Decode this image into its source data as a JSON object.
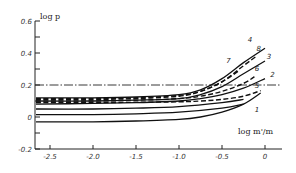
{
  "chart_data": {
    "type": "line",
    "title": "",
    "xlabel": "log m'/m",
    "ylabel": "log p",
    "xlim": [
      -2.75,
      0.2
    ],
    "ylim": [
      -0.2,
      0.6
    ],
    "xticks": [
      -2.5,
      -2.0,
      -1.5,
      -1.0,
      -0.5,
      0
    ],
    "xtick_labels": [
      "-2.5",
      "-2.0",
      "-1.5",
      "-1.0",
      "-0.5",
      "0"
    ],
    "yticks": [
      -0.2,
      0,
      0.2,
      0.4,
      0.6
    ],
    "ytick_labels": [
      "-0.2",
      "0",
      "0.2",
      "0.4",
      "0.6"
    ],
    "grid": false,
    "legend": "inline curve numbers",
    "reference_line": {
      "style": "dash-dot",
      "y": 0.2
    },
    "series": [
      {
        "name": "4",
        "style": "solid",
        "x": [
          -2.75,
          -2.0,
          -1.5,
          -1.0,
          -0.75,
          -0.5,
          -0.25,
          0
        ],
        "y": [
          0.12,
          0.12,
          0.125,
          0.14,
          0.17,
          0.24,
          0.34,
          0.43
        ]
      },
      {
        "name": "8",
        "style": "dashed",
        "x": [
          -2.75,
          -2.0,
          -1.5,
          -1.0,
          -0.75,
          -0.5,
          -0.25,
          -0.1
        ],
        "y": [
          0.115,
          0.115,
          0.12,
          0.135,
          0.16,
          0.22,
          0.32,
          0.38
        ]
      },
      {
        "name": "3",
        "style": "solid",
        "x": [
          -2.75,
          -2.0,
          -1.5,
          -1.0,
          -0.75,
          -0.5,
          -0.25,
          0
        ],
        "y": [
          0.1,
          0.1,
          0.105,
          0.115,
          0.14,
          0.19,
          0.27,
          0.35
        ]
      },
      {
        "name": "7",
        "style": "dashed",
        "x": [
          -2.75,
          -2.0,
          -1.5,
          -1.0,
          -0.75,
          -0.5,
          -0.3
        ],
        "y": [
          0.11,
          0.11,
          0.115,
          0.13,
          0.16,
          0.22,
          0.29
        ]
      },
      {
        "name": "6",
        "style": "dashed",
        "x": [
          -2.75,
          -2.0,
          -1.5,
          -1.0,
          -0.75,
          -0.5,
          -0.25,
          -0.1
        ],
        "y": [
          0.1,
          0.1,
          0.105,
          0.115,
          0.13,
          0.16,
          0.21,
          0.26
        ]
      },
      {
        "name": "2",
        "style": "solid",
        "x": [
          -2.75,
          -2.0,
          -1.5,
          -1.0,
          -0.75,
          -0.5,
          -0.25,
          0
        ],
        "y": [
          0.08,
          0.085,
          0.09,
          0.1,
          0.115,
          0.14,
          0.18,
          0.24
        ]
      },
      {
        "name": "5",
        "style": "dashed",
        "x": [
          -2.75,
          -2.0,
          -1.5,
          -1.0,
          -0.75,
          -0.5,
          -0.25,
          -0.05
        ],
        "y": [
          0.09,
          0.09,
          0.092,
          0.095,
          0.1,
          0.11,
          0.13,
          0.165
        ]
      },
      {
        "name": "1",
        "style": "solid",
        "x": [
          -2.75,
          -2.0,
          -1.5,
          -1.0,
          -0.75,
          -0.5,
          -0.25,
          -0.05
        ],
        "y": [
          -0.03,
          -0.03,
          -0.025,
          -0.015,
          0.0,
          0.03,
          0.08,
          0.15
        ]
      },
      {
        "name": "",
        "style": "solid",
        "x": [
          -2.75,
          -2.0,
          -1.5,
          -1.0,
          -0.5,
          -0.25
        ],
        "y": [
          0.05,
          0.05,
          0.055,
          0.065,
          0.09,
          0.11
        ]
      },
      {
        "name": "",
        "style": "solid",
        "x": [
          -2.75,
          -2.0,
          -1.5,
          -1.0,
          -0.5,
          -0.25
        ],
        "y": [
          0.015,
          0.015,
          0.02,
          0.03,
          0.055,
          0.08
        ]
      }
    ],
    "curve_labels": [
      {
        "text": "4",
        "x": -0.2,
        "y": 0.47
      },
      {
        "text": "8",
        "x": -0.1,
        "y": 0.41
      },
      {
        "text": "3",
        "x": 0.02,
        "y": 0.36
      },
      {
        "text": "7",
        "x": -0.45,
        "y": 0.34
      },
      {
        "text": "6",
        "x": -0.12,
        "y": 0.29
      },
      {
        "text": "2",
        "x": 0.06,
        "y": 0.25
      },
      {
        "text": "5",
        "x": -0.12,
        "y": 0.18
      },
      {
        "text": "1",
        "x": -0.12,
        "y": 0.03
      }
    ]
  }
}
